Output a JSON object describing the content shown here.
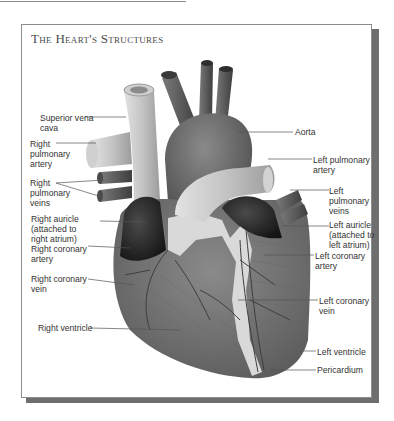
{
  "figure": {
    "title": "The Heart's Structures",
    "colors": {
      "frame_border": "#8c8c8c",
      "shadow": "#6e6e6e",
      "vessel_dark": "#5a5a5a",
      "vessel_light": "#bdbdbd",
      "muscle": "#7a7a7a",
      "auricle": "#2a2a2a",
      "fat": "#d8d8d8",
      "label_text": "#333333",
      "leader_line": "#555555"
    }
  },
  "labels_left": [
    {
      "id": "superior-vena-cava",
      "text": "Superior vena\ncava"
    },
    {
      "id": "right-pulmonary-artery",
      "text": "Right\npulmonary\nartery"
    },
    {
      "id": "right-pulmonary-veins",
      "text": "Right\npulmonary\nveins"
    },
    {
      "id": "right-auricle",
      "text": "Right auricle\n(attached to\nright atrium)"
    },
    {
      "id": "right-coronary-artery",
      "text": "Right coronary\nartery"
    },
    {
      "id": "right-coronary-vein",
      "text": "Right coronary\nvein"
    },
    {
      "id": "right-ventricle",
      "text": "Right ventricle"
    }
  ],
  "labels_right": [
    {
      "id": "aorta",
      "text": "Aorta"
    },
    {
      "id": "left-pulmonary-artery",
      "text": "Left pulmonary\nartery"
    },
    {
      "id": "left-pulmonary-veins",
      "text": "Left\npulmonary\nveins"
    },
    {
      "id": "left-auricle",
      "text": "Left auricle\n(attached to\nleft atrium)"
    },
    {
      "id": "left-coronary-artery",
      "text": "Left coronary\nartery"
    },
    {
      "id": "left-coronary-vein",
      "text": "Left coronary\nvein"
    },
    {
      "id": "left-ventricle",
      "text": "Left ventricle"
    },
    {
      "id": "pericardium",
      "text": "Pericardium"
    }
  ]
}
